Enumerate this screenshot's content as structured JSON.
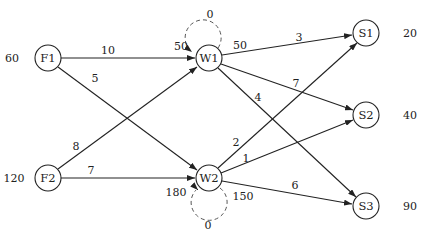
{
  "nodes": {
    "F1": {
      "label": "F1",
      "supply": "60"
    },
    "F2": {
      "label": "F2",
      "supply": "120"
    },
    "W1": {
      "label": "W1",
      "cap_in": "50",
      "cap_out": "50",
      "loop_cost": "0"
    },
    "W2": {
      "label": "W2",
      "cap_in": "180",
      "cap_out": "150",
      "loop_cost": "0"
    },
    "S1": {
      "label": "S1",
      "demand": "20"
    },
    "S2": {
      "label": "S2",
      "demand": "40"
    },
    "S3": {
      "label": "S3",
      "demand": "90"
    }
  },
  "edges": {
    "F1_W1": "10",
    "F1_W2": "5",
    "F2_W1": "8",
    "F2_W2": "7",
    "W1_S1": "3",
    "W1_S2": "7",
    "W1_S3": "4",
    "W2_S1": "2",
    "W2_S2": "1",
    "W2_S3": "6"
  }
}
